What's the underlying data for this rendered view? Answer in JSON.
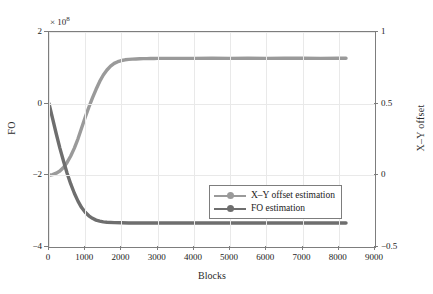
{
  "chart_data": {
    "type": "line",
    "title": "",
    "xlabel": "Blocks",
    "ylabel": "FO",
    "ylabel_right": "X–Y offset",
    "y_exponent_label": "× 10",
    "y_exponent_power": "8",
    "xlim": [
      0,
      9000
    ],
    "ylim_left": [
      -4,
      2
    ],
    "ylim_right": [
      -0.5,
      1
    ],
    "xticks": [
      "0",
      "1000",
      "2000",
      "3000",
      "4000",
      "5000",
      "6000",
      "7000",
      "8000",
      "9000"
    ],
    "xtick_values": [
      0,
      1000,
      2000,
      3000,
      4000,
      5000,
      6000,
      7000,
      8000,
      9000
    ],
    "yticks_left": [
      "2",
      "0",
      "−2",
      "−4"
    ],
    "ytick_values_left": [
      2,
      0,
      -2,
      -4
    ],
    "yticks_right": [
      "1",
      "0.5",
      "0",
      "−0.5"
    ],
    "ytick_values_right": [
      1,
      0.5,
      0,
      -0.5
    ],
    "grid": true,
    "legend_position": "lower right",
    "series": [
      {
        "name": "X–Y offset estimation",
        "axis": "right",
        "color": "#9a9a9a",
        "marker": "circle",
        "x": [
          0,
          100,
          200,
          300,
          400,
          500,
          600,
          700,
          800,
          900,
          1000,
          1100,
          1200,
          1300,
          1400,
          1500,
          1600,
          1700,
          1800,
          1900,
          2000,
          2100,
          2200,
          2300,
          2400,
          2500,
          2600,
          2700,
          2800,
          2900,
          3000,
          3200,
          3500,
          4000,
          4500,
          5000,
          5500,
          6000,
          6500,
          7000,
          7500,
          8000,
          8200
        ],
        "y": [
          0.0,
          0.005,
          0.015,
          0.03,
          0.055,
          0.09,
          0.135,
          0.19,
          0.255,
          0.33,
          0.405,
          0.475,
          0.54,
          0.6,
          0.655,
          0.7,
          0.735,
          0.762,
          0.781,
          0.793,
          0.801,
          0.806,
          0.809,
          0.811,
          0.812,
          0.813,
          0.814,
          0.814,
          0.815,
          0.815,
          0.816,
          0.816,
          0.816,
          0.816,
          0.817,
          0.816,
          0.817,
          0.816,
          0.817,
          0.817,
          0.816,
          0.817,
          0.817
        ]
      },
      {
        "name": "FO estimation",
        "axis": "left",
        "color": "#6e6e6e",
        "marker": "circle",
        "x": [
          0,
          100,
          200,
          300,
          400,
          500,
          600,
          700,
          800,
          900,
          1000,
          1100,
          1200,
          1300,
          1400,
          1500,
          1600,
          1800,
          2000,
          2200,
          2500,
          3000,
          3500,
          4000,
          4500,
          5000,
          5500,
          6000,
          6500,
          7000,
          7500,
          8000,
          8200
        ],
        "y": [
          0.0,
          -0.42,
          -0.84,
          -1.24,
          -1.6,
          -1.94,
          -2.24,
          -2.5,
          -2.72,
          -2.9,
          -3.03,
          -3.13,
          -3.2,
          -3.25,
          -3.28,
          -3.3,
          -3.31,
          -3.32,
          -3.325,
          -3.33,
          -3.33,
          -3.33,
          -3.33,
          -3.33,
          -3.33,
          -3.33,
          -3.33,
          -3.33,
          -3.33,
          -3.33,
          -3.33,
          -3.33,
          -3.33
        ]
      }
    ],
    "legend": [
      {
        "label": "X–Y offset estimation",
        "color": "#9a9a9a"
      },
      {
        "label": "FO estimation",
        "color": "#6e6e6e"
      }
    ]
  },
  "colors": {
    "axis": "#7d7d7d",
    "grid": "#e9e9e9",
    "background": "#ffffff",
    "text": "#222222"
  }
}
